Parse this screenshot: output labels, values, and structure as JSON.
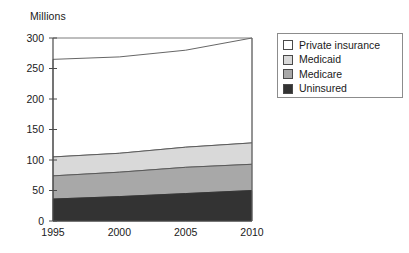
{
  "chart_data": {
    "type": "area",
    "stacked": true,
    "title": "",
    "subtitle": "",
    "xlabel": "",
    "ylabel": "Millions",
    "ylabel_position": "top-left",
    "x": [
      1995,
      2000,
      2005,
      2010
    ],
    "xticklabels": [
      "1995",
      "2000",
      "2005",
      "2010"
    ],
    "yticks": [
      0,
      50,
      100,
      150,
      200,
      250,
      300
    ],
    "yticklabels": [
      "0",
      "50",
      "100",
      "150",
      "200",
      "250",
      "300"
    ],
    "xlim": [
      1995,
      2010
    ],
    "ylim": [
      0,
      300
    ],
    "grid": false,
    "legend_position": "right-outside",
    "series": [
      {
        "name": "Uninsured",
        "color": "#333333",
        "values": [
          36,
          40,
          45,
          50
        ]
      },
      {
        "name": "Medicare",
        "color": "#a8a8a8",
        "values": [
          38,
          40,
          43,
          43
        ]
      },
      {
        "name": "Medicaid",
        "color": "#d9d9d9",
        "values": [
          31,
          31,
          33,
          35
        ]
      },
      {
        "name": "Private insurance",
        "color": "#ffffff",
        "values": [
          160,
          158,
          159,
          172
        ]
      }
    ],
    "cumulative_tops": {
      "Uninsured": [
        36,
        40,
        45,
        50
      ],
      "Medicare": [
        74,
        80,
        88,
        93
      ],
      "Medicaid": [
        105,
        111,
        121,
        128
      ],
      "Private insurance": [
        265,
        269,
        280,
        300
      ]
    },
    "legend": [
      {
        "label": "Private insurance",
        "swatch": "#ffffff"
      },
      {
        "label": "Medicaid",
        "swatch": "#d9d9d9"
      },
      {
        "label": "Medicare",
        "swatch": "#a8a8a8"
      },
      {
        "label": "Uninsured",
        "swatch": "#333333"
      }
    ]
  },
  "axes": {
    "unit_label": "Millions"
  }
}
